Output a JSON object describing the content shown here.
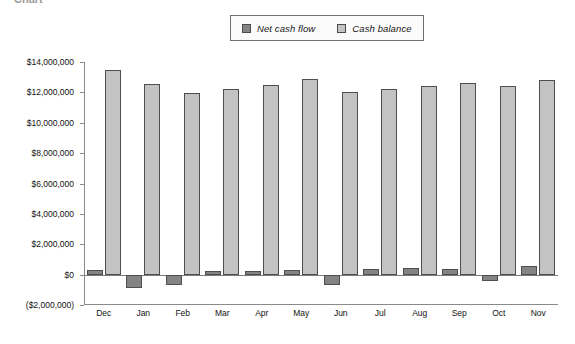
{
  "page": {
    "cut_off_heading": "Chart"
  },
  "legend": {
    "position": "top-center",
    "items": [
      {
        "label": "Net cash flow",
        "color": "#848484",
        "swatch": "dark"
      },
      {
        "label": "Cash balance",
        "color": "#c3c3c3",
        "swatch": "light"
      }
    ]
  },
  "axes": {
    "y_ticks": [
      "$14,000,000",
      "$12,000,000",
      "$10,000,000",
      "$8,000,000",
      "$6,000,000",
      "$4,000,000",
      "$2,000,000",
      "$0",
      "($2,000,000)"
    ],
    "y_tick_values": [
      14000000,
      12000000,
      10000000,
      8000000,
      6000000,
      4000000,
      2000000,
      0,
      -2000000
    ],
    "ymin": -2000000,
    "ymax": 14000000,
    "grid": false
  },
  "chart_data": {
    "type": "bar",
    "title": "",
    "subtitle": "",
    "xlabel": "",
    "ylabel": "",
    "ylim": [
      -2000000,
      14000000
    ],
    "grid": false,
    "legend_position": "top-center",
    "categories": [
      "Dec",
      "Jan",
      "Feb",
      "Mar",
      "Apr",
      "May",
      "Jun",
      "Jul",
      "Aug",
      "Sep",
      "Oct",
      "Nov"
    ],
    "series": [
      {
        "name": "Net cash flow",
        "color": "#848484",
        "values": [
          300000,
          -900000,
          -700000,
          250000,
          250000,
          300000,
          -700000,
          400000,
          450000,
          400000,
          -400000,
          550000
        ]
      },
      {
        "name": "Cash balance",
        "color": "#c3c3c3",
        "values": [
          13450000,
          12550000,
          11950000,
          12250000,
          12500000,
          12900000,
          12050000,
          12200000,
          12450000,
          12650000,
          12450000,
          12800000
        ]
      }
    ]
  }
}
